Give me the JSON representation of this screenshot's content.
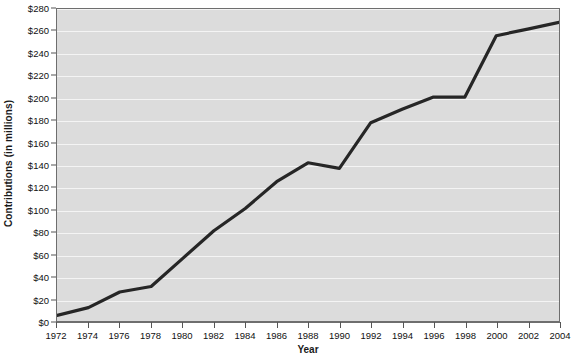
{
  "chart_data": {
    "type": "line",
    "title": "",
    "xlabel": "Year",
    "ylabel": "Contributions (in millions)",
    "x": [
      1972,
      1974,
      1976,
      1978,
      1980,
      1982,
      1984,
      1986,
      1988,
      1990,
      1992,
      1994,
      1996,
      1998,
      2000,
      2002,
      2004
    ],
    "values": [
      5,
      12,
      26,
      31,
      56,
      81,
      101,
      125,
      142,
      137,
      178,
      190,
      201,
      201,
      256,
      262,
      268
    ],
    "categories": [
      "1972",
      "1974",
      "1976",
      "1978",
      "1980",
      "1982",
      "1984",
      "1986",
      "1988",
      "1990",
      "1992",
      "1994",
      "1996",
      "1998",
      "2000",
      "2002",
      "2004"
    ],
    "xlim": [
      1972,
      2004
    ],
    "ylim": [
      0,
      280
    ],
    "y_ticks": [
      0,
      20,
      40,
      60,
      80,
      100,
      120,
      140,
      160,
      180,
      200,
      220,
      240,
      260,
      280
    ],
    "y_tick_labels": [
      "$0",
      "$20",
      "$40",
      "$60",
      "$80",
      "$100",
      "$120",
      "$140",
      "$160",
      "$180",
      "$200",
      "$220",
      "$240",
      "$260",
      "$280"
    ],
    "x_tick_labels": [
      "1972",
      "1974",
      "1976",
      "1978",
      "1980",
      "1982",
      "1984",
      "1986",
      "1988",
      "1990",
      "1992",
      "1994",
      "1996",
      "1998",
      "2000",
      "2002",
      "2004"
    ],
    "grid": true,
    "legend": false,
    "series": [
      {
        "name": "Contributions",
        "values": [
          5,
          12,
          26,
          31,
          56,
          81,
          101,
          125,
          142,
          137,
          178,
          190,
          201,
          201,
          256,
          262,
          268
        ]
      }
    ],
    "colors": {
      "line": "#262626",
      "plot_background": "#dcdcdc",
      "gridline": "#f4f4f4",
      "axis": "#6e6e6e",
      "text": "#111111",
      "page_background": "#ffffff"
    },
    "line_width": 3.2
  }
}
